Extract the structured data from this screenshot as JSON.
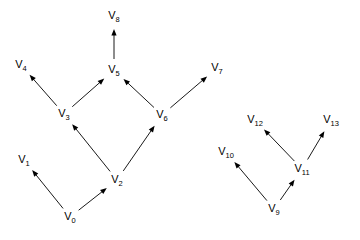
{
  "figure": {
    "kind": "directed-graph",
    "background_color": "#ffffff",
    "edge_color": "#000000",
    "label_color": "#000000",
    "width": 360,
    "height": 240
  },
  "graph_data": {
    "type": "digraph",
    "node_count": 14,
    "edge_count": 13,
    "components": 2,
    "nodes": [
      {
        "id": "V0",
        "base": "V",
        "subscript": "0",
        "x": 70,
        "y": 217
      },
      {
        "id": "V1",
        "base": "V",
        "subscript": "1",
        "x": 24,
        "y": 160
      },
      {
        "id": "V2",
        "base": "V",
        "subscript": "2",
        "x": 117,
        "y": 180
      },
      {
        "id": "V3",
        "base": "V",
        "subscript": "3",
        "x": 64,
        "y": 114
      },
      {
        "id": "V4",
        "base": "V",
        "subscript": "4",
        "x": 21,
        "y": 65
      },
      {
        "id": "V5",
        "base": "V",
        "subscript": "5",
        "x": 114,
        "y": 70
      },
      {
        "id": "V6",
        "base": "V",
        "subscript": "6",
        "x": 162,
        "y": 115
      },
      {
        "id": "V7",
        "base": "V",
        "subscript": "7",
        "x": 217,
        "y": 68
      },
      {
        "id": "V8",
        "base": "V",
        "subscript": "8",
        "x": 114,
        "y": 16
      },
      {
        "id": "V9",
        "base": "V",
        "subscript": "9",
        "x": 274,
        "y": 209
      },
      {
        "id": "V10",
        "base": "V",
        "subscript": "10",
        "x": 226,
        "y": 152
      },
      {
        "id": "V11",
        "base": "V",
        "subscript": "11",
        "x": 302,
        "y": 169
      },
      {
        "id": "V12",
        "base": "V",
        "subscript": "12",
        "x": 255,
        "y": 120
      },
      {
        "id": "V13",
        "base": "V",
        "subscript": "13",
        "x": 331,
        "y": 120
      }
    ],
    "edges": [
      {
        "from": "V0",
        "to": "V1"
      },
      {
        "from": "V0",
        "to": "V2"
      },
      {
        "from": "V2",
        "to": "V3"
      },
      {
        "from": "V2",
        "to": "V6"
      },
      {
        "from": "V3",
        "to": "V4"
      },
      {
        "from": "V3",
        "to": "V5"
      },
      {
        "from": "V6",
        "to": "V5"
      },
      {
        "from": "V6",
        "to": "V7"
      },
      {
        "from": "V5",
        "to": "V8"
      },
      {
        "from": "V9",
        "to": "V10"
      },
      {
        "from": "V9",
        "to": "V11"
      },
      {
        "from": "V11",
        "to": "V12"
      },
      {
        "from": "V11",
        "to": "V13"
      }
    ]
  }
}
